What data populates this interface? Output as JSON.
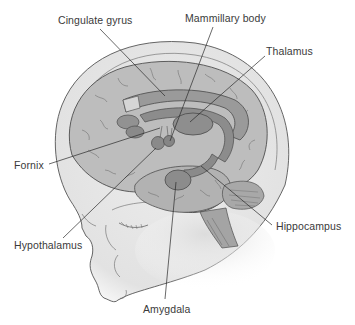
{
  "diagram": {
    "colors": {
      "background": "#ffffff",
      "skull_fill": "#e9e9e9",
      "brain_cortex": "#b9b9b9",
      "limbic_structures": "#8f8f8f",
      "outline": "#4a4a4a",
      "leader_line": "#2a2a2a",
      "label_text": "#3a3a3a"
    },
    "labels": [
      {
        "id": "cingulate-gyrus",
        "text": "Cingulate gyrus",
        "x": 58,
        "y": 14,
        "line": [
          100,
          29,
          165,
          96
        ]
      },
      {
        "id": "mammillary-body",
        "text": "Mammillary body",
        "x": 185,
        "y": 12,
        "line": [
          213,
          27,
          170,
          141
        ]
      },
      {
        "id": "thalamus",
        "text": "Thalamus",
        "x": 266,
        "y": 45,
        "line": [
          265,
          56,
          190,
          122
        ]
      },
      {
        "id": "fornix",
        "text": "Fornix",
        "x": 14,
        "y": 159,
        "line": [
          49,
          164,
          160,
          128
        ]
      },
      {
        "id": "hypothalamus",
        "text": "Hypothalamus",
        "x": 14,
        "y": 239,
        "line": [
          63,
          238,
          156,
          148
        ]
      },
      {
        "id": "amygdala",
        "text": "Amygdala",
        "x": 143,
        "y": 303,
        "line": [
          165,
          299,
          176,
          182
        ]
      },
      {
        "id": "hippocampus",
        "text": "Hippocampus",
        "x": 276,
        "y": 220,
        "line": [
          272,
          225,
          201,
          166
        ]
      }
    ]
  }
}
